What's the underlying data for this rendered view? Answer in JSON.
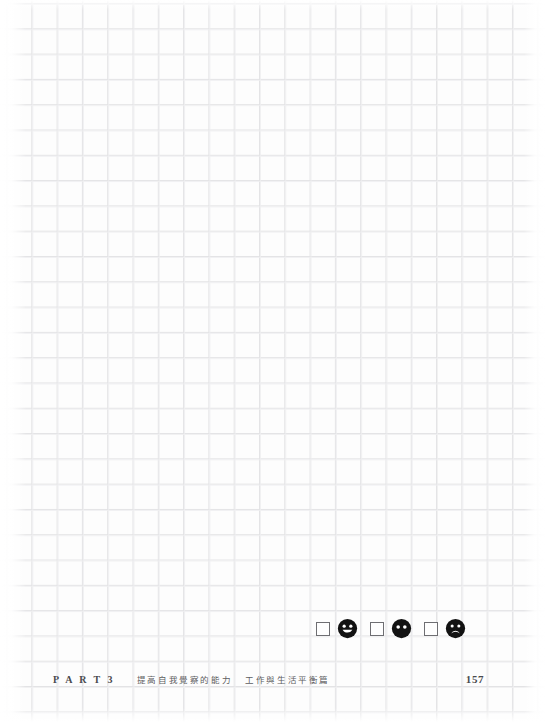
{
  "page": {
    "background_color": "#fdfdfd",
    "grid_line_color": "#e3e3e5",
    "grid_cell_px": 25,
    "width": 546,
    "height": 722,
    "type": "graph-paper-notebook-page"
  },
  "mood_rating": {
    "label": "mood rating checkbox row",
    "options": [
      {
        "checkbox_checked": false,
        "face": "happy-face",
        "face_symbol": "smiley"
      },
      {
        "checkbox_checked": false,
        "face": "neutral-face",
        "face_symbol": "neutral"
      },
      {
        "checkbox_checked": false,
        "face": "sad-face",
        "face_symbol": "frowny"
      }
    ],
    "face_color": "#121212",
    "checkbox_border_color": "#6e6e72"
  },
  "footer": {
    "part_label": "P A R T 3",
    "section_title_1": "提高自我覺察的能力",
    "section_title_2": "工作與生活平衡篇",
    "page_number": "157",
    "text_color": "#4a4a4e"
  }
}
